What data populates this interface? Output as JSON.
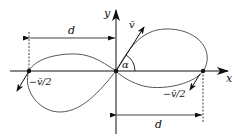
{
  "diagram": {
    "axes": {
      "x_label": "x",
      "y_label": "y"
    },
    "velocity_label": "v̄",
    "angle_label": "α",
    "left_velocity_label": "−v̄/2",
    "right_velocity_label": "−v̄/2",
    "upper_distance_label": "d",
    "lower_distance_label": "d",
    "colors": {
      "stroke": "#111111",
      "curve": "#444444",
      "background": "#ffffff"
    }
  }
}
